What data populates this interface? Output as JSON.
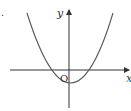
{
  "diagram": {
    "type": "function-graph",
    "labels": {
      "y_axis": "y",
      "x_axis": "x",
      "origin": "O",
      "marker": "."
    },
    "colors": {
      "axis": "#333333",
      "curve": "#555555",
      "background": "#ffffff"
    }
  }
}
